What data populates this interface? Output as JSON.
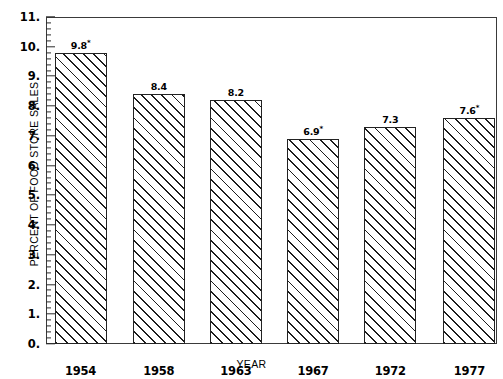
{
  "chart_data": {
    "type": "bar",
    "title": "",
    "subtitle": "",
    "xlabel": "YEAR",
    "ylabel": "PERCENT OF FOOD STORE SALES",
    "categories": [
      "1954",
      "1958",
      "1963",
      "1967",
      "1972",
      "1977"
    ],
    "values": [
      9.8,
      8.4,
      8.2,
      6.9,
      7.3,
      7.6
    ],
    "data_labels": [
      "9.8",
      "8.4",
      "8.2",
      "6.9",
      "7.3",
      "7.6"
    ],
    "data_label_footnote_marks": [
      "*",
      "",
      "",
      "*",
      "",
      "*"
    ],
    "ylim": [
      0,
      11
    ],
    "xlim_categorical": true,
    "y_major_step": 1,
    "y_minor_step": 0.2,
    "y_tick_labels": [
      "0.",
      "1.",
      "2.",
      "3.",
      "4.",
      "5.",
      "6.",
      "7.",
      "8.",
      "9.",
      "10.",
      "11."
    ],
    "y_tick_values": [
      0,
      1,
      2,
      3,
      4,
      5,
      6,
      7,
      8,
      9,
      10,
      11
    ],
    "grid": false,
    "legend": null,
    "legend_position": "none",
    "bar_fill": "hatch-diagonal-45",
    "bar_edge_color": "#222222",
    "bar_face_color": "#ffffff",
    "axis_color": "#3a3a3a",
    "background": "#ffffff",
    "series": [
      {
        "name": "Percent of food store sales",
        "values": [
          9.8,
          8.4,
          8.2,
          6.9,
          7.3,
          7.6
        ]
      }
    ]
  }
}
